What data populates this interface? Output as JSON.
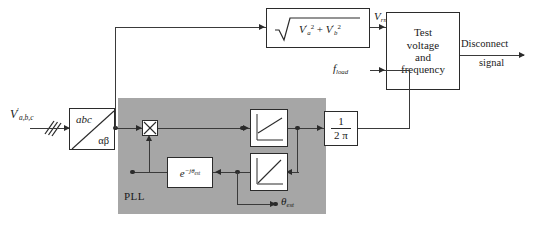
{
  "diagram": {
    "title_label": "PLL",
    "input_signal": {
      "base": "V",
      "prime": "′",
      "sub": "a,b,c"
    },
    "blocks": {
      "abc_transform": {
        "top_label": "abc",
        "bottom_label": "αβ"
      },
      "rms": {
        "radicand_a": "V",
        "radicand_a_sub": "a",
        "plus": "+",
        "radicand_b": "V",
        "radicand_b_sub": "b",
        "power": "2"
      },
      "test": {
        "line1": "Test",
        "line2": "voltage",
        "line3": "and",
        "line4": "frequency"
      },
      "gain": {
        "numerator": "1",
        "denominator": "2 π"
      },
      "phase_shift": {
        "base": "e",
        "exponent": "−jθ",
        "exponent_sub": "est"
      },
      "multiplier": {
        "symbol": "✕"
      },
      "integrator_top": {
        "name": "saturation-ramp"
      },
      "integrator_bottom": {
        "name": "ramp"
      }
    },
    "signals": {
      "vrms": {
        "base": "V",
        "sub": "rms"
      },
      "fload": {
        "base": "f",
        "sub": "load"
      },
      "theta_est": {
        "base": "θ",
        "sub": "est"
      },
      "disconnect": {
        "line1": "Disconnect",
        "line2": "signal"
      }
    },
    "colors": {
      "pll_fill": "#a6a6a6",
      "line": "#2b2b2b",
      "background": "#ffffff"
    }
  }
}
